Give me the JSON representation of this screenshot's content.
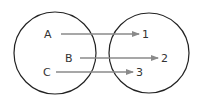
{
  "diagram": {
    "type": "mapping",
    "domain_set": {
      "elements": [
        "A",
        "B",
        "C"
      ]
    },
    "codomain_set": {
      "elements": [
        "1",
        "2",
        "3"
      ]
    },
    "mappings": [
      {
        "from": "A",
        "to": "1"
      },
      {
        "from": "B",
        "to": "2"
      },
      {
        "from": "C",
        "to": "3"
      }
    ],
    "colors": {
      "circle": "#222222",
      "arrow": "#8a8a8a",
      "text": "#333333"
    }
  }
}
